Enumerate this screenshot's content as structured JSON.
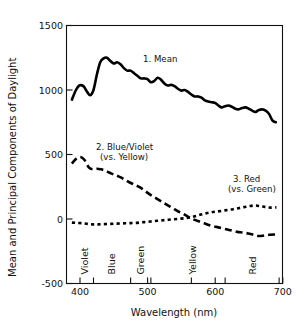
{
  "chart_data": {
    "type": "line",
    "title": "",
    "xlabel": "Wavelength (nm)",
    "ylabel": "Mean and Principal Components of Daylight",
    "xlim": [
      385,
      705
    ],
    "ylim": [
      -500,
      1500
    ],
    "xticks": [
      400,
      500,
      600,
      700
    ],
    "xtick_labels": [
      "400",
      "500",
      "600",
      "700"
    ],
    "yticks": [
      -500,
      0,
      500,
      1000,
      1500
    ],
    "ytick_labels": [
      "-500",
      "0",
      "500",
      "1000",
      "1500"
    ],
    "grid": false,
    "legend_position": "inline-annotations",
    "band_dividers": [
      425,
      480,
      510,
      570,
      620,
      700
    ],
    "bands": [
      {
        "label": "Violet",
        "center": 412
      },
      {
        "label": "Blue",
        "center": 452
      },
      {
        "label": "Green",
        "center": 495
      },
      {
        "label": "Yellow",
        "center": 572
      },
      {
        "label": "Red",
        "center": 660
      }
    ],
    "series": [
      {
        "name": "1. Mean",
        "style": "solid",
        "annotation": "1. Mean",
        "annotation_lines": [
          "1. Mean"
        ],
        "x": [
          393,
          399,
          404,
          410,
          415,
          420,
          425,
          430,
          435,
          440,
          445,
          450,
          455,
          460,
          465,
          470,
          475,
          480,
          485,
          490,
          495,
          500,
          505,
          510,
          515,
          520,
          525,
          530,
          535,
          540,
          545,
          550,
          555,
          560,
          565,
          570,
          575,
          580,
          585,
          590,
          595,
          600,
          605,
          610,
          615,
          620,
          625,
          630,
          635,
          640,
          645,
          650,
          655,
          660,
          665,
          670,
          675,
          680,
          685,
          690,
          695
        ],
        "y": [
          925,
          1000,
          1035,
          1030,
          990,
          960,
          1000,
          1120,
          1215,
          1245,
          1250,
          1225,
          1205,
          1215,
          1200,
          1170,
          1150,
          1150,
          1130,
          1110,
          1090,
          1090,
          1085,
          1060,
          1070,
          1095,
          1080,
          1050,
          1035,
          1040,
          1030,
          1010,
          995,
          1000,
          985,
          965,
          950,
          950,
          940,
          920,
          910,
          905,
          900,
          880,
          865,
          875,
          880,
          870,
          855,
          850,
          860,
          865,
          855,
          840,
          830,
          845,
          850,
          840,
          815,
          765,
          750
        ]
      },
      {
        "name": "2. Blue/Violet (vs. Yellow)",
        "style": "long-dash",
        "annotation": "2. Blue/Violet (vs. Yellow)",
        "annotation_lines": [
          "2. Blue/Violet",
          "(vs. Yellow)"
        ],
        "x": [
          393,
          400,
          406,
          412,
          418,
          424,
          430,
          436,
          442,
          448,
          455,
          462,
          470,
          478,
          486,
          494,
          502,
          510,
          518,
          526,
          534,
          542,
          550,
          558,
          566,
          574,
          582,
          590,
          598,
          606,
          614,
          622,
          630,
          638,
          646,
          654,
          662,
          670,
          678,
          686,
          694
        ],
        "y": [
          430,
          470,
          480,
          455,
          400,
          385,
          390,
          385,
          375,
          360,
          345,
          330,
          310,
          285,
          265,
          245,
          215,
          185,
          160,
          135,
          110,
          85,
          60,
          40,
          15,
          -5,
          -20,
          -35,
          -50,
          -60,
          -70,
          -80,
          -90,
          -100,
          -105,
          -112,
          -122,
          -132,
          -128,
          -122,
          -120
        ]
      },
      {
        "name": "3. Red (vs. Green)",
        "style": "short-dash",
        "annotation": "3. Red (vs. Green)",
        "annotation_lines": [
          "3. Red",
          "(vs. Green)"
        ],
        "x": [
          393,
          400,
          408,
          416,
          424,
          432,
          440,
          448,
          456,
          464,
          472,
          480,
          488,
          496,
          504,
          512,
          520,
          528,
          536,
          544,
          552,
          560,
          568,
          576,
          584,
          592,
          600,
          608,
          616,
          624,
          632,
          640,
          648,
          656,
          664,
          672,
          680,
          688,
          696
        ],
        "y": [
          -28,
          -30,
          -32,
          -38,
          -42,
          -42,
          -40,
          -38,
          -36,
          -35,
          -33,
          -32,
          -30,
          -26,
          -22,
          -18,
          -14,
          -10,
          -6,
          -2,
          2,
          6,
          12,
          22,
          34,
          44,
          52,
          58,
          64,
          70,
          76,
          84,
          92,
          100,
          105,
          100,
          92,
          88,
          90
        ]
      }
    ],
    "annotations": [
      {
        "id": "mean-label",
        "text": "1. Mean",
        "x_px": 143,
        "y_px": 62
      },
      {
        "id": "bv-label-line1",
        "text": "2. Blue/Violet",
        "x_px": 96,
        "y_px": 150
      },
      {
        "id": "bv-label-line2",
        "text": "(vs. Yellow)",
        "x_px": 100,
        "y_px": 160
      },
      {
        "id": "red-label-line1",
        "text": "3. Red",
        "x_px": 233,
        "y_px": 182
      },
      {
        "id": "red-label-line2",
        "text": "(vs. Green)",
        "x_px": 228,
        "y_px": 192
      }
    ]
  }
}
